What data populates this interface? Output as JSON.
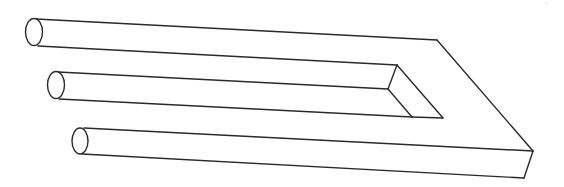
{
  "figure": {
    "title": "Impossible trident (blivet) illusion",
    "kind": "line-drawing",
    "colors": {
      "background": "#ffffff",
      "stroke": "#2a2a2a"
    },
    "prongs": [
      {
        "name": "top-prong",
        "end": "cylindrical"
      },
      {
        "name": "middle-prong",
        "end": "cylindrical"
      },
      {
        "name": "bottom-prong",
        "end": "cylindrical"
      }
    ],
    "base": {
      "name": "rectangular-bar",
      "shape": "U-shaped block with notch"
    }
  }
}
